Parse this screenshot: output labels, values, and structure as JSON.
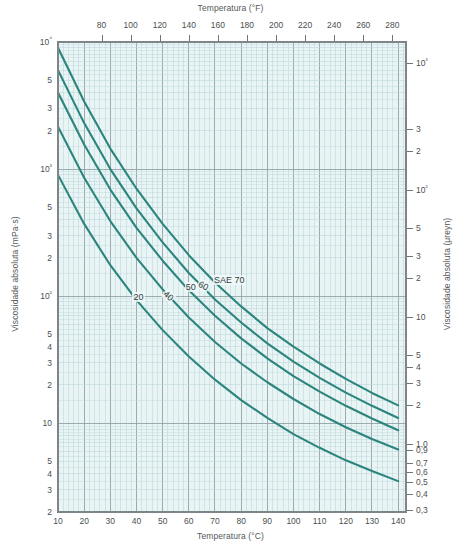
{
  "chart_data": {
    "type": "line",
    "title": "",
    "xlabel": "Temperatura (°C)",
    "ylabel": "Viscosidade absoluta (mPa·s)",
    "x2label": "Temperatura (°F)",
    "y2label": "Viscosidade absoluta (μreyn)",
    "xscale": "linear",
    "yscale": "log",
    "xlim": [
      10,
      143
    ],
    "ylim": [
      2,
      10000
    ],
    "x2lim": [
      50,
      289.4
    ],
    "y2lim": [
      0.29,
      1450
    ],
    "grid": true,
    "legend": "inline-curve-labels",
    "xticks": [
      10,
      20,
      30,
      40,
      50,
      60,
      70,
      80,
      90,
      100,
      110,
      120,
      130,
      140
    ],
    "xticklabels": [
      "10",
      "20",
      "30",
      "40",
      "50",
      "60",
      "70",
      "80",
      "90",
      "100",
      "110",
      "120",
      "130",
      "140"
    ],
    "x2ticks": [
      80,
      100,
      120,
      140,
      160,
      180,
      200,
      220,
      240,
      260,
      280
    ],
    "x2ticklabels": [
      "80",
      "100",
      "120",
      "140",
      "160",
      "180",
      "200",
      "220",
      "240",
      "260",
      "280"
    ],
    "yticks": [
      10000,
      5000,
      3000,
      2000,
      1000,
      500,
      300,
      200,
      100,
      50,
      40,
      30,
      20,
      10,
      5,
      4,
      3,
      2
    ],
    "yticklabels": [
      "10⁴",
      "5",
      "3",
      "2",
      "10³",
      "5",
      "3",
      "2",
      "10²",
      "5",
      "4",
      "3",
      "2",
      "10",
      "5",
      "4",
      "3",
      "2"
    ],
    "y2ticks": [
      1000,
      300,
      200,
      100,
      50,
      30,
      20,
      10,
      5,
      4,
      3,
      2,
      1.0,
      0.9,
      0.7,
      0.6,
      0.5,
      0.4,
      0.3
    ],
    "y2ticklabels": [
      "10³",
      "3",
      "2",
      "10²",
      "5",
      "3",
      "2",
      "10",
      "5",
      "4",
      "3",
      "2",
      "1,0",
      "0,9",
      "0,7",
      "0,6",
      "0,5",
      "0,4",
      "0,3"
    ],
    "series": [
      {
        "name": "SAE 70",
        "label": "SAE 70",
        "color": "#2b857c",
        "x": [
          10,
          20,
          30,
          40,
          50,
          60,
          70,
          80,
          90,
          100,
          110,
          120,
          130,
          140
        ],
        "y": [
          9000,
          3400,
          1450,
          700,
          370,
          210,
          128,
          83,
          56,
          40,
          29.5,
          22.3,
          17.3,
          13.8
        ]
      },
      {
        "name": "SAE 60",
        "label": "60",
        "color": "#2b857c",
        "x": [
          10,
          20,
          30,
          40,
          50,
          60,
          70,
          80,
          90,
          100,
          110,
          120,
          130,
          140
        ],
        "y": [
          6000,
          2300,
          1000,
          490,
          265,
          152,
          94,
          62,
          42.5,
          30.5,
          22.7,
          17.4,
          13.7,
          11.0
        ]
      },
      {
        "name": "SAE 50",
        "label": "50",
        "color": "#2b857c",
        "x": [
          10,
          20,
          30,
          40,
          50,
          60,
          70,
          80,
          90,
          100,
          110,
          120,
          130,
          140
        ],
        "y": [
          4000,
          1560,
          690,
          345,
          190,
          111,
          70,
          46.5,
          32.4,
          23.5,
          17.7,
          13.7,
          10.9,
          8.8
        ]
      },
      {
        "name": "SAE 40",
        "label": "40",
        "color": "#2b857c",
        "x": [
          10,
          20,
          30,
          40,
          50,
          60,
          70,
          80,
          90,
          100,
          110,
          120,
          130,
          140
        ],
        "y": [
          2150,
          855,
          390,
          200,
          113,
          68,
          43.5,
          29.5,
          21.0,
          15.5,
          11.8,
          9.3,
          7.5,
          6.2
        ]
      },
      {
        "name": "SAE 20",
        "label": "20",
        "color": "#2b857c",
        "x": [
          10,
          20,
          30,
          40,
          50,
          60,
          70,
          80,
          90,
          100,
          110,
          120,
          130,
          140
        ],
        "y": [
          900,
          370,
          175,
          93,
          54,
          33.5,
          22.0,
          15.2,
          11.0,
          8.2,
          6.4,
          5.1,
          4.2,
          3.5
        ]
      }
    ],
    "colors": {
      "curve": "#2b857c",
      "plot_background": "#e9f4f5",
      "minor_grid": "#bcd7da",
      "major_grid": "#8f9ea3",
      "frame": "#7d8588",
      "text": "#4c4f51"
    }
  }
}
